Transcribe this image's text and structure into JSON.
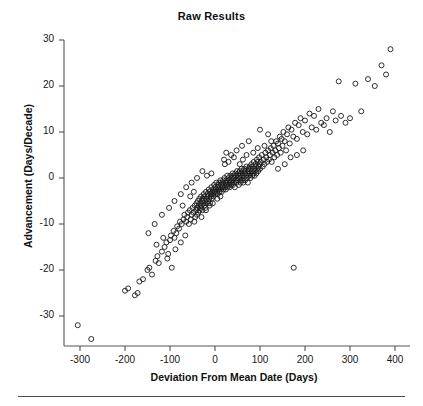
{
  "figure": {
    "title": "Raw Results",
    "footer_rule": true,
    "background_color": "#ffffff",
    "marker_color": "#1a1a1a"
  },
  "chart_data": {
    "type": "scatter",
    "title": "Raw Results",
    "xlabel": "Deviation From Mean Date (Days)",
    "ylabel": "Advancement (Days/Decade)",
    "xlim": [
      -340,
      430
    ],
    "ylim": [
      -37,
      32
    ],
    "xticks": [
      -300,
      -200,
      -100,
      0,
      100,
      200,
      300,
      400
    ],
    "xtick_labels": [
      "-300",
      "-200",
      "-100",
      "0",
      "100",
      "200",
      "300",
      "400"
    ],
    "yticks": [
      30,
      20,
      10,
      0,
      -10,
      -20,
      -30
    ],
    "ytick_labels": [
      "30",
      "20",
      "10",
      "0",
      "-10",
      "-20",
      "-30"
    ],
    "grid": false,
    "legend": null,
    "marker": "open-circle",
    "marker_size": 5,
    "series": [
      {
        "name": "observations",
        "points": [
          [
            -305,
            -32.0
          ],
          [
            -275,
            -35.0
          ],
          [
            -200,
            -24.5
          ],
          [
            -193,
            -24.0
          ],
          [
            -178,
            -25.5
          ],
          [
            -172,
            -25.0
          ],
          [
            -168,
            -22.5
          ],
          [
            -160,
            -22.0
          ],
          [
            -150,
            -20.0
          ],
          [
            -146,
            -19.5
          ],
          [
            -140,
            -21.0
          ],
          [
            -132,
            -18.0
          ],
          [
            -128,
            -17.0
          ],
          [
            -125,
            -18.5
          ],
          [
            -118,
            -16.0
          ],
          [
            -112,
            -15.0
          ],
          [
            -108,
            -14.0
          ],
          [
            -104,
            -16.5
          ],
          [
            -100,
            -13.5
          ],
          [
            -98,
            -12.5
          ],
          [
            -96,
            -19.5
          ],
          [
            -92,
            -11.5
          ],
          [
            -90,
            -13.0
          ],
          [
            -86,
            -12.0
          ],
          [
            -84,
            -10.5
          ],
          [
            -80,
            -11.0
          ],
          [
            -78,
            -9.5
          ],
          [
            -76,
            -14.0
          ],
          [
            -74,
            -10.0
          ],
          [
            -70,
            -9.0
          ],
          [
            -68,
            -8.0
          ],
          [
            -66,
            -12.5
          ],
          [
            -64,
            -9.5
          ],
          [
            -62,
            -8.5
          ],
          [
            -60,
            -7.5
          ],
          [
            -58,
            -10.0
          ],
          [
            -56,
            -7.0
          ],
          [
            -54,
            -9.0
          ],
          [
            -52,
            -8.0
          ],
          [
            -50,
            -6.5
          ],
          [
            -48,
            -7.5
          ],
          [
            -46,
            -9.5
          ],
          [
            -45,
            -6.0
          ],
          [
            -44,
            -8.5
          ],
          [
            -42,
            -7.0
          ],
          [
            -41,
            -5.5
          ],
          [
            -40,
            -8.0
          ],
          [
            -39,
            -6.5
          ],
          [
            -38,
            -5.0
          ],
          [
            -37,
            -7.5
          ],
          [
            -36,
            -6.0
          ],
          [
            -35,
            -4.5
          ],
          [
            -34,
            -7.0
          ],
          [
            -33,
            -5.5
          ],
          [
            -32,
            -6.5
          ],
          [
            -31,
            -4.0
          ],
          [
            -30,
            -6.0
          ],
          [
            -29,
            -5.0
          ],
          [
            -28,
            -7.0
          ],
          [
            -27,
            -4.5
          ],
          [
            -26,
            -5.5
          ],
          [
            -25,
            -3.5
          ],
          [
            -24,
            -6.0
          ],
          [
            -23,
            -4.0
          ],
          [
            -22,
            -5.0
          ],
          [
            -21,
            -6.5
          ],
          [
            -20,
            -3.0
          ],
          [
            -19,
            -4.5
          ],
          [
            -18,
            -5.5
          ],
          [
            -17,
            -3.5
          ],
          [
            -16,
            -4.0
          ],
          [
            -15,
            -5.0
          ],
          [
            -14,
            -2.5
          ],
          [
            -13,
            -4.5
          ],
          [
            -12,
            -3.0
          ],
          [
            -11,
            -5.5
          ],
          [
            -10,
            -3.5
          ],
          [
            -9,
            -4.0
          ],
          [
            -8,
            -2.0
          ],
          [
            -7,
            -4.5
          ],
          [
            -6,
            -3.0
          ],
          [
            -5,
            -3.5
          ],
          [
            -4,
            -2.5
          ],
          [
            -3,
            -4.0
          ],
          [
            -2,
            -1.5
          ],
          [
            -1,
            -3.0
          ],
          [
            0,
            -2.0
          ],
          [
            1,
            -3.5
          ],
          [
            2,
            -2.5
          ],
          [
            3,
            -1.0
          ],
          [
            4,
            -3.0
          ],
          [
            5,
            -2.0
          ],
          [
            6,
            -3.5
          ],
          [
            7,
            -1.5
          ],
          [
            8,
            -2.5
          ],
          [
            9,
            -1.0
          ],
          [
            10,
            -3.0
          ],
          [
            11,
            -2.0
          ],
          [
            12,
            -0.5
          ],
          [
            13,
            -2.5
          ],
          [
            14,
            -1.5
          ],
          [
            15,
            -3.0
          ],
          [
            16,
            -1.0
          ],
          [
            17,
            -2.0
          ],
          [
            18,
            -0.5
          ],
          [
            19,
            -2.5
          ],
          [
            20,
            -1.5
          ],
          [
            21,
            0.0
          ],
          [
            22,
            -2.0
          ],
          [
            23,
            -1.0
          ],
          [
            24,
            -2.5
          ],
          [
            25,
            -0.5
          ],
          [
            26,
            -1.5
          ],
          [
            27,
            0.5
          ],
          [
            28,
            -2.0
          ],
          [
            29,
            -1.0
          ],
          [
            30,
            0.0
          ],
          [
            31,
            -1.5
          ],
          [
            32,
            -0.5
          ],
          [
            33,
            -2.0
          ],
          [
            34,
            0.5
          ],
          [
            35,
            -1.0
          ],
          [
            36,
            -1.5
          ],
          [
            37,
            0.0
          ],
          [
            38,
            -0.5
          ],
          [
            39,
            1.0
          ],
          [
            40,
            -1.5
          ],
          [
            41,
            0.5
          ],
          [
            42,
            -1.0
          ],
          [
            43,
            0.0
          ],
          [
            44,
            -2.0
          ],
          [
            45,
            1.0
          ],
          [
            46,
            -0.5
          ],
          [
            47,
            0.5
          ],
          [
            48,
            -1.0
          ],
          [
            49,
            1.5
          ],
          [
            50,
            0.0
          ],
          [
            51,
            -0.5
          ],
          [
            52,
            1.0
          ],
          [
            53,
            -1.5
          ],
          [
            54,
            0.5
          ],
          [
            55,
            1.5
          ],
          [
            56,
            0.0
          ],
          [
            57,
            -1.0
          ],
          [
            58,
            1.0
          ],
          [
            59,
            2.0
          ],
          [
            60,
            -0.5
          ],
          [
            61,
            0.5
          ],
          [
            62,
            1.5
          ],
          [
            63,
            -1.0
          ],
          [
            64,
            0.0
          ],
          [
            65,
            2.0
          ],
          [
            66,
            1.0
          ],
          [
            67,
            -0.5
          ],
          [
            68,
            1.5
          ],
          [
            69,
            0.5
          ],
          [
            70,
            2.5
          ],
          [
            71,
            0.0
          ],
          [
            72,
            1.0
          ],
          [
            73,
            -1.0
          ],
          [
            74,
            2.0
          ],
          [
            75,
            1.5
          ],
          [
            76,
            0.5
          ],
          [
            77,
            2.5
          ],
          [
            78,
            1.0
          ],
          [
            79,
            0.0
          ],
          [
            80,
            2.0
          ],
          [
            81,
            3.0
          ],
          [
            82,
            1.5
          ],
          [
            83,
            0.5
          ],
          [
            84,
            2.5
          ],
          [
            85,
            1.0
          ],
          [
            86,
            3.5
          ],
          [
            87,
            2.0
          ],
          [
            88,
            0.5
          ],
          [
            89,
            1.5
          ],
          [
            90,
            3.0
          ],
          [
            91,
            2.5
          ],
          [
            92,
            1.0
          ],
          [
            93,
            4.0
          ],
          [
            94,
            2.0
          ],
          [
            95,
            3.5
          ],
          [
            96,
            1.5
          ],
          [
            97,
            2.5
          ],
          [
            98,
            4.5
          ],
          [
            99,
            3.0
          ],
          [
            100,
            2.0
          ],
          [
            102,
            3.5
          ],
          [
            104,
            5.0
          ],
          [
            106,
            2.5
          ],
          [
            108,
            4.0
          ],
          [
            110,
            3.0
          ],
          [
            112,
            5.5
          ],
          [
            114,
            4.5
          ],
          [
            116,
            3.5
          ],
          [
            118,
            6.0
          ],
          [
            120,
            4.0
          ],
          [
            122,
            5.0
          ],
          [
            124,
            6.5
          ],
          [
            126,
            3.5
          ],
          [
            128,
            5.5
          ],
          [
            130,
            7.0
          ],
          [
            132,
            4.5
          ],
          [
            134,
            6.0
          ],
          [
            136,
            8.0
          ],
          [
            138,
            5.0
          ],
          [
            140,
            7.5
          ],
          [
            142,
            6.5
          ],
          [
            144,
            9.0
          ],
          [
            146,
            5.5
          ],
          [
            148,
            8.5
          ],
          [
            150,
            7.0
          ],
          [
            152,
            10.0
          ],
          [
            155,
            8.0
          ],
          [
            158,
            6.0
          ],
          [
            160,
            9.5
          ],
          [
            163,
            11.0
          ],
          [
            166,
            7.5
          ],
          [
            170,
            10.5
          ],
          [
            174,
            9.0
          ],
          [
            175,
            -19.5
          ],
          [
            178,
            12.0
          ],
          [
            182,
            8.5
          ],
          [
            186,
            11.5
          ],
          [
            190,
            13.0
          ],
          [
            195,
            10.0
          ],
          [
            200,
            12.5
          ],
          [
            205,
            9.5
          ],
          [
            210,
            14.0
          ],
          [
            215,
            11.0
          ],
          [
            220,
            13.5
          ],
          [
            225,
            10.5
          ],
          [
            230,
            15.0
          ],
          [
            236,
            12.0
          ],
          [
            242,
            11.5
          ],
          [
            248,
            13.0
          ],
          [
            255,
            10.0
          ],
          [
            262,
            14.5
          ],
          [
            268,
            12.5
          ],
          [
            275,
            21.0
          ],
          [
            280,
            13.5
          ],
          [
            290,
            12.0
          ],
          [
            300,
            13.0
          ],
          [
            312,
            20.5
          ],
          [
            325,
            14.5
          ],
          [
            340,
            21.5
          ],
          [
            355,
            20.0
          ],
          [
            370,
            24.5
          ],
          [
            380,
            22.5
          ],
          [
            390,
            28.0
          ],
          [
            -130,
            -14.5
          ],
          [
            -115,
            -13.0
          ],
          [
            -106,
            -17.5
          ],
          [
            -88,
            -15.5
          ],
          [
            -72,
            -6.0
          ],
          [
            -55,
            -4.0
          ],
          [
            -47,
            -3.0
          ],
          [
            -30,
            -8.5
          ],
          [
            -20,
            -7.0
          ],
          [
            -12,
            -6.0
          ],
          [
            -5,
            -5.5
          ],
          [
            5,
            -4.5
          ],
          [
            12,
            -4.0
          ],
          [
            20,
            4.0
          ],
          [
            25,
            5.5
          ],
          [
            30,
            3.5
          ],
          [
            42,
            4.5
          ],
          [
            55,
            3.0
          ],
          [
            62,
            4.0
          ],
          [
            70,
            5.0
          ],
          [
            85,
            5.5
          ],
          [
            95,
            6.5
          ],
          [
            110,
            7.0
          ],
          [
            125,
            8.0
          ],
          [
            140,
            2.0
          ],
          [
            155,
            3.0
          ],
          [
            168,
            4.5
          ],
          [
            182,
            5.0
          ],
          [
            196,
            6.0
          ],
          [
            100,
            10.5
          ],
          [
            118,
            9.5
          ],
          [
            75,
            8.0
          ],
          [
            60,
            7.0
          ],
          [
            48,
            6.0
          ],
          [
            36,
            5.0
          ],
          [
            22,
            3.0
          ],
          [
            -8,
            1.0
          ],
          [
            -18,
            0.5
          ],
          [
            -28,
            1.5
          ],
          [
            -40,
            0.0
          ],
          [
            -52,
            -1.0
          ],
          [
            -64,
            -2.0
          ],
          [
            -76,
            -3.5
          ],
          [
            -90,
            -5.0
          ],
          [
            -102,
            -6.5
          ],
          [
            -118,
            -8.0
          ],
          [
            -134,
            -10.0
          ],
          [
            -148,
            -12.0
          ]
        ]
      }
    ]
  },
  "axes": {
    "x_tick_labels": [
      "-300",
      "-200",
      "-100",
      "0",
      "100",
      "200",
      "300",
      "400"
    ],
    "y_tick_labels": [
      "30",
      "20",
      "10",
      "0",
      "-10",
      "-20",
      "-30"
    ],
    "x_axis_title": "Deviation From Mean Date (Days)",
    "y_axis_title": "Advancement (Days/Decade)"
  }
}
